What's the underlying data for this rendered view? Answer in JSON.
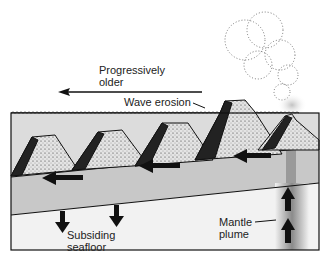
{
  "diagram": {
    "labels": {
      "progressively_older": [
        "Progressively",
        "older"
      ],
      "wave_erosion": "Wave erosion",
      "subsiding_seafloor": [
        "Subsiding",
        "seafloor"
      ],
      "mantle_plume": [
        "Mantle",
        "plume"
      ]
    },
    "colors": {
      "ocean": "#dcdcdc",
      "plate": "#c8c8c8",
      "mantle": "#f2f2f2",
      "plume": "#8a8a8a",
      "ink": "#111111"
    },
    "volcanoes": [
      "oldest-seamount",
      "guyot",
      "eroded-island",
      "eroded-island-2",
      "active-volcano"
    ],
    "plate_motion_arrows": 4,
    "subsidence_arrows": 2,
    "plume_arrows": 2
  }
}
